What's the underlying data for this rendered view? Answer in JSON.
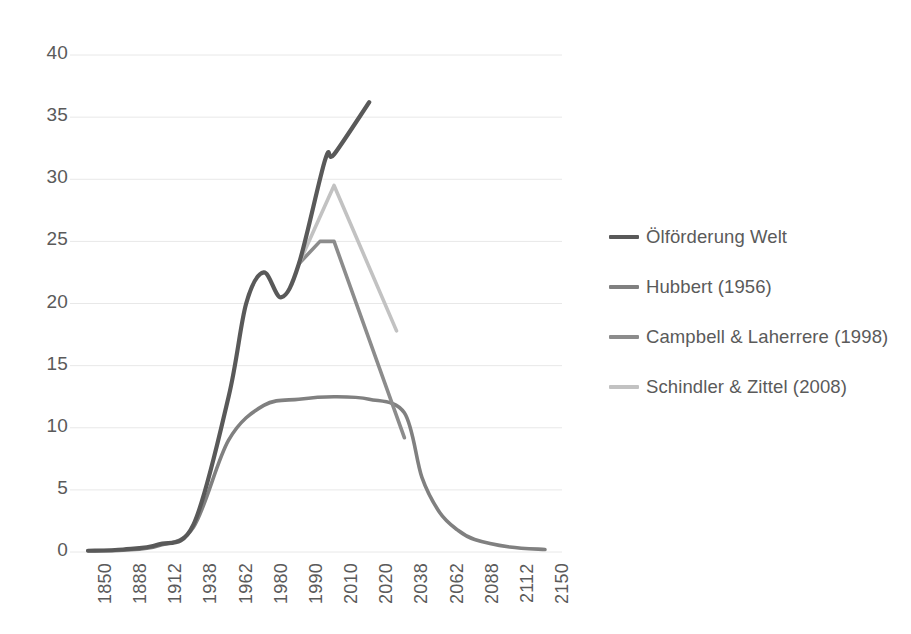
{
  "chart_data": {
    "type": "line",
    "title": "",
    "subtitle": "",
    "xlabel": "",
    "ylabel": "",
    "ylim": [
      0,
      40
    ],
    "ytick_values": [
      0,
      5,
      10,
      15,
      20,
      25,
      30,
      35,
      40
    ],
    "ytick_labels": [
      "0",
      "5",
      "10",
      "15",
      "20",
      "25",
      "30",
      "35",
      "40"
    ],
    "categories": [
      "1850",
      "1888",
      "1912",
      "1938",
      "1962",
      "1980",
      "1990",
      "2010",
      "2020",
      "2038",
      "2062",
      "2088",
      "2112",
      "2150"
    ],
    "grid": "horizontal",
    "legend_position": "right",
    "series": [
      {
        "name": "Ölförderung Welt",
        "color": "#595959",
        "values": [
          0.1,
          0.2,
          0.6,
          2.2,
          12.5,
          22.5,
          23.2,
          29.8,
          36.2,
          null,
          null,
          null,
          null,
          null
        ],
        "points": [
          {
            "x": "1850",
            "y": 0.1
          },
          {
            "x": "1888",
            "y": 0.2
          },
          {
            "x": "1912",
            "y": 0.6
          },
          {
            "x": "1938",
            "y": 2.2
          },
          {
            "x": "1962",
            "y": 12.5
          },
          {
            "x": "1971",
            "y": 20.0
          },
          {
            "x": "1980",
            "y": 22.5
          },
          {
            "x": "1985",
            "y": 20.5
          },
          {
            "x": "1990",
            "y": 23.2
          },
          {
            "x": "2005",
            "y": 31.6
          },
          {
            "x": "2010",
            "y": 32.0
          },
          {
            "x": "2020",
            "y": 36.2
          }
        ]
      },
      {
        "name": "Hubbert (1956)",
        "color": "#808080",
        "values": [
          0.1,
          0.15,
          0.5,
          2.0,
          9.0,
          11.8,
          12.3,
          12.5,
          12.3,
          11.2,
          3.2,
          1.0,
          0.4,
          0.2
        ],
        "points": [
          {
            "x": "1850",
            "y": 0.1
          },
          {
            "x": "1888",
            "y": 0.15
          },
          {
            "x": "1912",
            "y": 0.5
          },
          {
            "x": "1938",
            "y": 2.0
          },
          {
            "x": "1962",
            "y": 9.0
          },
          {
            "x": "1980",
            "y": 11.8
          },
          {
            "x": "1990",
            "y": 12.3
          },
          {
            "x": "2010",
            "y": 12.5
          },
          {
            "x": "2020",
            "y": 12.3
          },
          {
            "x": "2038",
            "y": 11.2
          },
          {
            "x": "2050",
            "y": 6.0
          },
          {
            "x": "2062",
            "y": 3.2
          },
          {
            "x": "2075",
            "y": 1.8
          },
          {
            "x": "2088",
            "y": 1.0
          },
          {
            "x": "2112",
            "y": 0.4
          },
          {
            "x": "2150",
            "y": 0.2
          }
        ]
      },
      {
        "name": "Campbell & Laherrere (1998)",
        "color": "#8c8c8c",
        "values": [
          null,
          null,
          null,
          null,
          null,
          null,
          23.2,
          25.0,
          24.0,
          9.2,
          null,
          null,
          null,
          null
        ],
        "points": [
          {
            "x": "1990",
            "y": 23.2
          },
          {
            "x": "2002",
            "y": 25.0
          },
          {
            "x": "2010",
            "y": 25.0
          },
          {
            "x": "2038",
            "y": 9.2
          }
        ]
      },
      {
        "name": "Schindler & Zittel (2008)",
        "color": "#c2c2c2",
        "values": [
          null,
          null,
          null,
          null,
          null,
          null,
          23.2,
          29.5,
          26.0,
          17.8,
          null,
          null,
          null,
          null
        ],
        "points": [
          {
            "x": "1990",
            "y": 23.2
          },
          {
            "x": "2010",
            "y": 29.5
          },
          {
            "x": "2034",
            "y": 17.8
          }
        ]
      }
    ]
  },
  "axes": {
    "y": {
      "ticks": [
        {
          "label": "40"
        },
        {
          "label": "35"
        },
        {
          "label": "30"
        },
        {
          "label": "25"
        },
        {
          "label": "20"
        },
        {
          "label": "15"
        },
        {
          "label": "10"
        },
        {
          "label": "5"
        },
        {
          "label": "0"
        }
      ]
    },
    "x": {
      "ticks": [
        {
          "label": "1850"
        },
        {
          "label": "1888"
        },
        {
          "label": "1912"
        },
        {
          "label": "1938"
        },
        {
          "label": "1962"
        },
        {
          "label": "1980"
        },
        {
          "label": "1990"
        },
        {
          "label": "2010"
        },
        {
          "label": "2020"
        },
        {
          "label": "2038"
        },
        {
          "label": "2062"
        },
        {
          "label": "2088"
        },
        {
          "label": "2112"
        },
        {
          "label": "2150"
        }
      ]
    }
  },
  "legend": {
    "items": [
      {
        "label": "Ölförderung Welt",
        "color": "#595959"
      },
      {
        "label": "Hubbert (1956)",
        "color": "#808080"
      },
      {
        "label": "Campbell & Laherrere (1998)",
        "color": "#8c8c8c"
      },
      {
        "label": "Schindler & Zittel (2008)",
        "color": "#c2c2c2"
      }
    ]
  },
  "colors": {
    "gridline": "#e8e8e8",
    "text": "#5a5a5a",
    "background": "#ffffff"
  }
}
